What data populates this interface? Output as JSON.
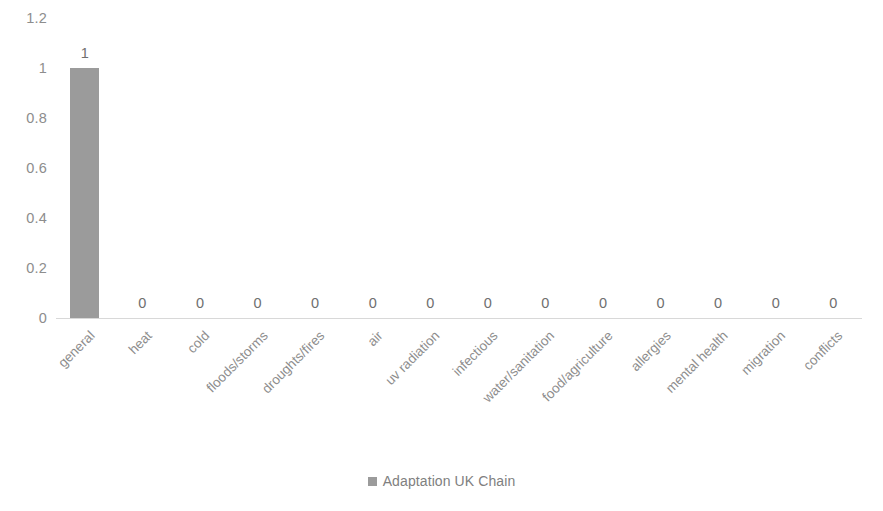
{
  "chart_data": {
    "type": "bar",
    "title": "",
    "xlabel": "",
    "ylabel": "",
    "ylim": [
      0,
      1.2
    ],
    "grid": false,
    "legend_position": "bottom",
    "categories": [
      "general",
      "heat",
      "cold",
      "floods/storms",
      "droughts/fires",
      "air",
      "uv radiation",
      "infectious",
      "water/sanitation",
      "food/agriculture",
      "allergies",
      "mental health",
      "migration",
      "conflicts"
    ],
    "series": [
      {
        "name": "Adaptation UK Chain",
        "color": "#9b9b9b",
        "values": [
          1,
          0,
          0,
          0,
          0,
          0,
          0,
          0,
          0,
          0,
          0,
          0,
          0,
          0
        ]
      }
    ],
    "data_labels": [
      "1",
      "0",
      "0",
      "0",
      "0",
      "0",
      "0",
      "0",
      "0",
      "0",
      "0",
      "0",
      "0",
      "0"
    ],
    "y_ticks": [
      0,
      0.2,
      0.4,
      0.6,
      0.8,
      1,
      1.2
    ],
    "y_tick_labels": [
      "0",
      "0.2",
      "0.4",
      "0.6",
      "0.8",
      "1",
      "1.2"
    ]
  },
  "legend": {
    "items": [
      {
        "label": "Adaptation UK Chain",
        "color": "#9b9b9b",
        "marker": "square-marker"
      }
    ]
  },
  "colors": {
    "bar": "#9b9b9b",
    "axis_line": "#d8d8d8",
    "tick_text": "#8d8d8d",
    "label_text": "#8d8d8d",
    "value_text": "#6f6f6f",
    "legend_text": "#808080",
    "background": "#ffffff"
  }
}
